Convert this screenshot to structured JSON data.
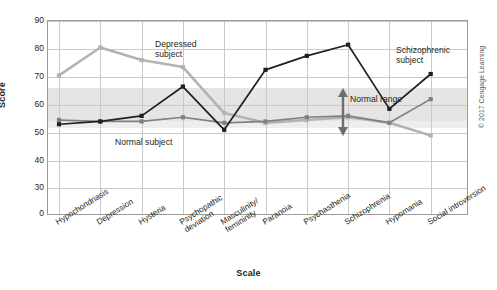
{
  "chart_data": {
    "type": "line",
    "title": "",
    "xlabel": "Scale",
    "ylabel": "Score",
    "ylim": [
      30,
      90
    ],
    "yticks": [
      90,
      80,
      70,
      60,
      50,
      40,
      30,
      0
    ],
    "axis_break": true,
    "grid": true,
    "legend": "annotations",
    "categories": [
      "Hypochondriasis",
      "Depression",
      "Hysteria",
      "Psychopathic\ndeviation",
      "Masculinity/\nfemininity",
      "Paranoia",
      "Psychasthenia",
      "Schizophrenia",
      "Hypomania",
      "Social introversion"
    ],
    "series": [
      {
        "name": "Depressed subject",
        "color": "#b3b3b3",
        "values": [
          70.5,
          80.5,
          76,
          73.5,
          57,
          53.5,
          54.5,
          55.5,
          53.5,
          49
        ]
      },
      {
        "name": "Normal subject",
        "color": "#808080",
        "values": [
          54.5,
          54,
          54,
          55.5,
          53.5,
          54,
          55.5,
          56,
          53.5,
          62
        ]
      },
      {
        "name": "Schizophrenic subject",
        "color": "#231f20",
        "values": [
          53,
          54,
          56,
          66.5,
          51,
          72.5,
          77.5,
          81.5,
          58.5,
          71
        ]
      }
    ],
    "bands": [
      {
        "name": "Normal range",
        "from": 53,
        "to": 65,
        "color": "#e6e5e4"
      }
    ],
    "annotations": [
      {
        "name": "depressed-subject-label",
        "text": "Depressed\nsubject"
      },
      {
        "name": "normal-subject-label",
        "text": "Normal subject"
      },
      {
        "name": "schizophrenic-subject-label",
        "text": "Schizophrenic\nsubject"
      },
      {
        "name": "normal-range-label",
        "text": "Normal range"
      }
    ]
  },
  "axes": {
    "y_title": "Score",
    "x_title": "Scale",
    "y_ticks": [
      "90",
      "80",
      "70",
      "60",
      "50",
      "40",
      "30",
      "0"
    ],
    "x_ticks": [
      "Hypochondriasis",
      "Depression",
      "Hysteria",
      "Psychopathic\ndeviation",
      "Masculinity/\nfemininity",
      "Paranoia",
      "Psychasthenia",
      "Schizophrenia",
      "Hypomania",
      "Social introversion"
    ]
  },
  "annotations": {
    "depressed": "Depressed\nsubject",
    "normal_subject": "Normal subject",
    "schizophrenic": "Schizophrenic\nsubject",
    "normal_range": "Normal range"
  },
  "credit": "© 2017 Cengage Learning"
}
